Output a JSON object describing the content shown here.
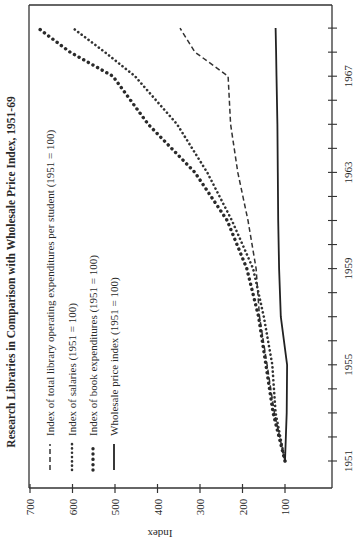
{
  "chart_data": {
    "type": "line",
    "orientation": "rotated-90-clockwise",
    "title": "Research Libraries in Comparison with Wholesale Price Index, 1951-69",
    "xlabel": "",
    "ylabel": "Index",
    "x_ticks": [
      "1951",
      "1955",
      "1959",
      "1963",
      "1967"
    ],
    "x_range": [
      1951,
      1969
    ],
    "y_ticks": [
      "100",
      "200",
      "300",
      "400",
      "500",
      "600",
      "700"
    ],
    "ylim": [
      0,
      700
    ],
    "grid": false,
    "legend_position": "upper-left (in rotated frame)",
    "x": [
      1951,
      1953,
      1955,
      1957,
      1959,
      1961,
      1963,
      1965,
      1967,
      1968,
      1969
    ],
    "series": [
      {
        "name": "Index of total library operating expenditures per student (1951 = 100)",
        "style": "dashed",
        "values": [
          100,
          125,
          142,
          160,
          168,
          187,
          211,
          228,
          234,
          312,
          347
        ]
      },
      {
        "name": "Index of salaries (1951 = 100)",
        "style": "dotted-fine",
        "values": [
          100,
          122,
          130,
          150,
          175,
          225,
          283,
          354,
          453,
          524,
          599
        ]
      },
      {
        "name": "Index of book expenditures (1951 = 100)",
        "style": "dotted-heavy",
        "values": [
          100,
          128,
          145,
          162,
          190,
          236,
          312,
          422,
          505,
          606,
          681
        ]
      },
      {
        "name": "Wholesale price index (1951 = 100)",
        "style": "solid",
        "values": [
          100,
          96,
          95,
          110,
          114,
          116,
          117,
          118,
          120,
          121,
          122
        ]
      }
    ]
  }
}
